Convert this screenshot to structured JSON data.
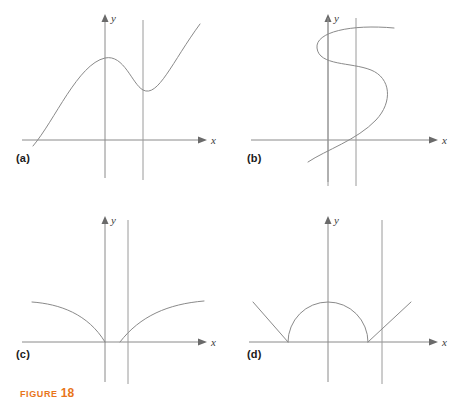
{
  "figure": {
    "caption_label": "FIGURE",
    "caption_number": "18",
    "axis_x_label": "x",
    "axis_y_label": "y"
  },
  "panels": [
    {
      "id": "a",
      "label": "(a)",
      "curve_kind": "cubic-with-local-max-and-local-min",
      "test_line": "vertical-line-at-local-minimum"
    },
    {
      "id": "b",
      "label": "(b)",
      "curve_kind": "sideways-s-shaped-curve",
      "test_line": "vertical-line-crossing-curve-three-times"
    },
    {
      "id": "c",
      "label": "(c)",
      "curve_kind": "two-root-like-branches-meeting-x-axis",
      "test_line": "vertical-line-right-of-origin"
    },
    {
      "id": "d",
      "label": "(d)",
      "curve_kind": "two-rays-with-semicircular-arc",
      "test_line": "vertical-line-right-of-arc"
    }
  ]
}
